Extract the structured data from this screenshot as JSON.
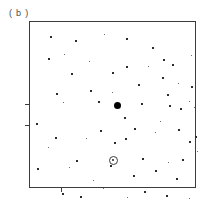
{
  "figure": {
    "panel_label": "( b )",
    "frame_color": "#3c3c3c",
    "background_color": "#ffffff",
    "point_color": "#2b2b2b",
    "center_marker_color": "#000000",
    "circled_marker_color": "#3d3d3d"
  },
  "chart_data": {
    "type": "scatter",
    "title": "( b )",
    "xlabel": "",
    "ylabel": "",
    "xlim": [
      0,
      167
    ],
    "ylim": [
      0,
      167
    ],
    "grid": false,
    "legend": "none",
    "axis_note": "unlabeled square frame with two left-edge ticks and one bottom-edge tick",
    "ticks": {
      "left": [
        83,
        104
      ],
      "bottom": [
        32
      ]
    },
    "series": [
      {
        "name": "field-points",
        "marker": "small-square",
        "points": [
          [
            22,
            16
          ],
          [
            47,
            20
          ],
          [
            75,
            13
          ],
          [
            98,
            18
          ],
          [
            20,
            38
          ],
          [
            35,
            33
          ],
          [
            124,
            27
          ],
          [
            135,
            39
          ],
          [
            60,
            40
          ],
          [
            98,
            46
          ],
          [
            144,
            44
          ],
          [
            162,
            34
          ],
          [
            43,
            53
          ],
          [
            84,
            52
          ],
          [
            119,
            45
          ],
          [
            134,
            57
          ],
          [
            110,
            64
          ],
          [
            149,
            62
          ],
          [
            28,
            73
          ],
          [
            62,
            70
          ],
          [
            83,
            71
          ],
          [
            139,
            74
          ],
          [
            163,
            66
          ],
          [
            34,
            81
          ],
          [
            70,
            81
          ],
          [
            113,
            83
          ],
          [
            160,
            80
          ],
          [
            141,
            85
          ],
          [
            152,
            88
          ],
          [
            165,
            86
          ],
          [
            96,
            97
          ],
          [
            8,
            103
          ],
          [
            131,
            100
          ],
          [
            72,
            110
          ],
          [
            106,
            108
          ],
          [
            126,
            111
          ],
          [
            150,
            109
          ],
          [
            27,
            117
          ],
          [
            57,
            117
          ],
          [
            97,
            118
          ],
          [
            167,
            116
          ],
          [
            19,
            126
          ],
          [
            86,
            122
          ],
          [
            161,
            121
          ],
          [
            168,
            130
          ],
          [
            48,
            140
          ],
          [
            114,
            138
          ],
          [
            139,
            141
          ],
          [
            154,
            139
          ],
          [
            9,
            148
          ],
          [
            40,
            146
          ],
          [
            82,
            145
          ],
          [
            127,
            150
          ],
          [
            64,
            159
          ],
          [
            105,
            155
          ],
          [
            148,
            158
          ],
          [
            74,
            167
          ],
          [
            34,
            173
          ],
          [
            52,
            176
          ],
          [
            98,
            176
          ],
          [
            116,
            171
          ],
          [
            138,
            175
          ],
          [
            160,
            177
          ]
        ]
      },
      {
        "name": "central-bright-source",
        "marker": "large-filled-circle",
        "points": [
          [
            88,
            84
          ]
        ]
      },
      {
        "name": "circled-source",
        "marker": "open-circle-with-dot",
        "points": [
          [
            84,
            139
          ]
        ]
      }
    ]
  }
}
